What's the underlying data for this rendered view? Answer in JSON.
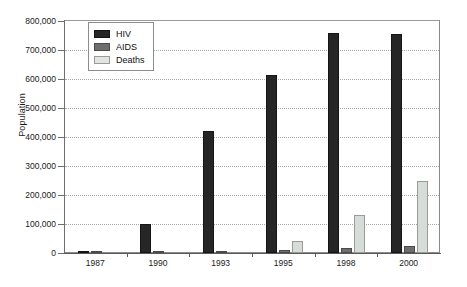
{
  "chart_data": {
    "type": "bar",
    "title": "",
    "subtitle": "",
    "xlabel": "",
    "ylabel": "Population",
    "categories": [
      "1987",
      "1990",
      "1993",
      "1995",
      "1998",
      "2000"
    ],
    "series": [
      {
        "name": "HIV",
        "color": "#262626",
        "values": [
          5000,
          100000,
          420000,
          615000,
          760000,
          755000
        ]
      },
      {
        "name": "AIDS",
        "color": "#6e6e6e",
        "values": [
          2000,
          3000,
          3000,
          10000,
          18000,
          25000
        ]
      },
      {
        "name": "Deaths",
        "color": "#d6dcd7",
        "values": [
          0,
          0,
          0,
          40000,
          130000,
          250000
        ]
      }
    ],
    "ylim": [
      0,
      800000
    ],
    "ytick_values": [
      0,
      100000,
      200000,
      300000,
      400000,
      500000,
      600000,
      700000,
      800000
    ],
    "ytick_labels": [
      "0",
      "100,000",
      "200,000",
      "300,000",
      "400,000",
      "500,000",
      "600,000",
      "700,000",
      "800,000"
    ],
    "grid": true,
    "grid_style": "dotted-horizontal",
    "legend": {
      "position": "top-left-inside",
      "entries": [
        {
          "label": "HIV",
          "swatch": "hiv"
        },
        {
          "label": "AIDS",
          "swatch": "aids"
        },
        {
          "label": "Deaths",
          "swatch": "deaths"
        }
      ]
    },
    "caption": ""
  }
}
